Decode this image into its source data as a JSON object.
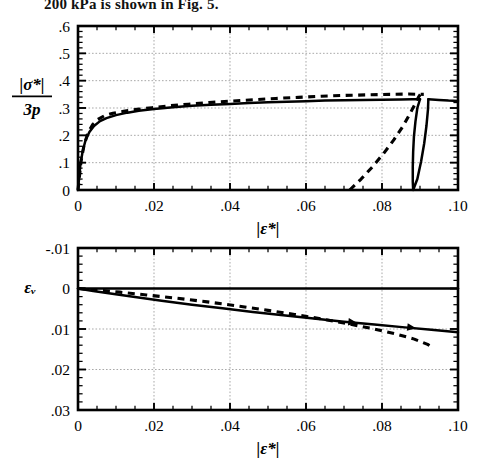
{
  "page": {
    "caption_above": "200 kPa is shown in Fig. 5."
  },
  "chart_data": [
    {
      "id": "stress-ratio-plot",
      "type": "line",
      "title": "",
      "xlabel": "|ε*|",
      "ylabel_numerator": "|σ*|",
      "ylabel_denominator": "3p",
      "xlim": [
        0,
        0.1
      ],
      "ylim": [
        0,
        0.6
      ],
      "grid": true,
      "xticks": [
        0,
        0.02,
        0.04,
        0.06,
        0.08,
        0.1
      ],
      "xticklabels": [
        "0",
        ".02",
        ".04",
        ".06",
        ".08",
        ".10"
      ],
      "yticks": [
        0,
        0.1,
        0.2,
        0.3,
        0.4,
        0.5,
        0.6
      ],
      "yticklabels": [
        "0",
        ".1",
        ".2",
        ".3",
        ".4",
        ".5",
        ".6"
      ],
      "x_minor_step": 0.005,
      "y_minor_step": 0.02,
      "series": [
        {
          "name": "solid-loading",
          "style": "solid",
          "points": [
            [
              0.0,
              0.0
            ],
            [
              0.0006,
              0.09
            ],
            [
              0.0012,
              0.14
            ],
            [
              0.002,
              0.183
            ],
            [
              0.003,
              0.212
            ],
            [
              0.0042,
              0.234
            ],
            [
              0.0058,
              0.252
            ],
            [
              0.0075,
              0.263
            ],
            [
              0.01,
              0.274
            ],
            [
              0.013,
              0.283
            ],
            [
              0.016,
              0.29
            ],
            [
              0.02,
              0.296
            ],
            [
              0.025,
              0.303
            ],
            [
              0.03,
              0.308
            ],
            [
              0.035,
              0.312
            ],
            [
              0.04,
              0.315
            ],
            [
              0.045,
              0.318
            ],
            [
              0.05,
              0.321
            ],
            [
              0.055,
              0.323
            ],
            [
              0.06,
              0.325
            ],
            [
              0.065,
              0.327
            ],
            [
              0.07,
              0.328
            ],
            [
              0.075,
              0.329
            ],
            [
              0.08,
              0.33
            ],
            [
              0.085,
              0.331
            ],
            [
              0.088,
              0.332
            ],
            [
              0.09,
              0.332
            ]
          ]
        },
        {
          "name": "solid-unload-loop",
          "style": "solid",
          "points": [
            [
              0.09,
              0.332
            ],
            [
              0.0893,
              0.3
            ],
            [
              0.0888,
              0.25
            ],
            [
              0.0884,
              0.195
            ],
            [
              0.0882,
              0.14
            ],
            [
              0.0881,
              0.085
            ],
            [
              0.0881,
              0.03
            ],
            [
              0.0882,
              0.0
            ],
            [
              0.0893,
              0.04
            ],
            [
              0.0903,
              0.105
            ],
            [
              0.0911,
              0.17
            ],
            [
              0.0917,
              0.235
            ],
            [
              0.0921,
              0.295
            ],
            [
              0.0922,
              0.332
            ]
          ]
        },
        {
          "name": "solid-reload-tail",
          "style": "solid",
          "points": [
            [
              0.0922,
              0.332
            ],
            [
              0.095,
              0.329
            ],
            [
              0.0975,
              0.327
            ],
            [
              0.1,
              0.326
            ]
          ]
        },
        {
          "name": "dashed-loading",
          "style": "dashed",
          "points": [
            [
              0.0,
              0.0
            ],
            [
              0.0008,
              0.105
            ],
            [
              0.0016,
              0.165
            ],
            [
              0.0026,
              0.208
            ],
            [
              0.0038,
              0.238
            ],
            [
              0.0052,
              0.258
            ],
            [
              0.007,
              0.272
            ],
            [
              0.0092,
              0.281
            ],
            [
              0.012,
              0.288
            ],
            [
              0.0155,
              0.295
            ],
            [
              0.0195,
              0.301
            ],
            [
              0.024,
              0.308
            ],
            [
              0.029,
              0.314
            ],
            [
              0.0345,
              0.32
            ],
            [
              0.04,
              0.325
            ],
            [
              0.046,
              0.33
            ],
            [
              0.052,
              0.335
            ],
            [
              0.058,
              0.339
            ],
            [
              0.064,
              0.343
            ],
            [
              0.07,
              0.346
            ],
            [
              0.076,
              0.348
            ],
            [
              0.082,
              0.35
            ],
            [
              0.087,
              0.351
            ],
            [
              0.091,
              0.35
            ]
          ]
        },
        {
          "name": "dashed-unload",
          "style": "dashed",
          "points": [
            [
              0.0715,
              0.0
            ],
            [
              0.0745,
              0.04
            ],
            [
              0.0775,
              0.085
            ],
            [
              0.0805,
              0.135
            ],
            [
              0.0832,
              0.185
            ],
            [
              0.0855,
              0.233
            ],
            [
              0.0872,
              0.275
            ],
            [
              0.0886,
              0.312
            ],
            [
              0.0896,
              0.34
            ],
            [
              0.0902,
              0.352
            ]
          ]
        }
      ]
    },
    {
      "id": "volumetric-strain-plot",
      "type": "line",
      "title": "",
      "xlabel": "|ε*|",
      "ylabel": "εᵥ",
      "xlim": [
        0,
        0.1
      ],
      "ylim": [
        -0.01,
        0.03
      ],
      "y_inverted": true,
      "grid": true,
      "xticks": [
        0,
        0.02,
        0.04,
        0.06,
        0.08,
        0.1
      ],
      "xticklabels": [
        "0",
        ".02",
        ".04",
        ".06",
        ".08",
        ".10"
      ],
      "yticks": [
        -0.01,
        0,
        0.01,
        0.02,
        0.03
      ],
      "yticklabels": [
        "-.01",
        "0",
        ".01",
        ".02",
        ".03"
      ],
      "x_minor_step": 0.005,
      "y_minor_step": 0.002,
      "series": [
        {
          "name": "zero-reference-line",
          "style": "solid",
          "points": [
            [
              0.0,
              0.0
            ],
            [
              0.1,
              0.0
            ]
          ]
        },
        {
          "name": "solid-volumetric",
          "style": "solid",
          "points": [
            [
              0.0,
              0.0
            ],
            [
              0.004,
              0.0006
            ],
            [
              0.009,
              0.0013
            ],
            [
              0.015,
              0.0021
            ],
            [
              0.022,
              0.003
            ],
            [
              0.03,
              0.004
            ],
            [
              0.038,
              0.0049
            ],
            [
              0.046,
              0.0058
            ],
            [
              0.054,
              0.0066
            ],
            [
              0.062,
              0.0074
            ],
            [
              0.07,
              0.0082
            ],
            [
              0.078,
              0.0089
            ],
            [
              0.086,
              0.0096
            ],
            [
              0.093,
              0.0102
            ],
            [
              0.1,
              0.0108
            ]
          ],
          "arrows": [
            {
              "x": 0.0735,
              "y": 0.0085,
              "angle": 7
            },
            {
              "x": 0.089,
              "y": 0.0098,
              "angle": 7
            }
          ]
        },
        {
          "name": "dashed-volumetric",
          "style": "dashed",
          "points": [
            [
              0.0,
              0.0
            ],
            [
              0.005,
              0.0004
            ],
            [
              0.011,
              0.0009
            ],
            [
              0.018,
              0.0016
            ],
            [
              0.026,
              0.0024
            ],
            [
              0.034,
              0.0033
            ],
            [
              0.042,
              0.0043
            ],
            [
              0.05,
              0.0054
            ],
            [
              0.057,
              0.0064
            ],
            [
              0.064,
              0.0075
            ],
            [
              0.071,
              0.0087
            ],
            [
              0.0775,
              0.0099
            ],
            [
              0.0835,
              0.0112
            ],
            [
              0.0885,
              0.0125
            ],
            [
              0.092,
              0.0138
            ],
            [
              0.0935,
              0.0146
            ]
          ]
        }
      ]
    }
  ]
}
